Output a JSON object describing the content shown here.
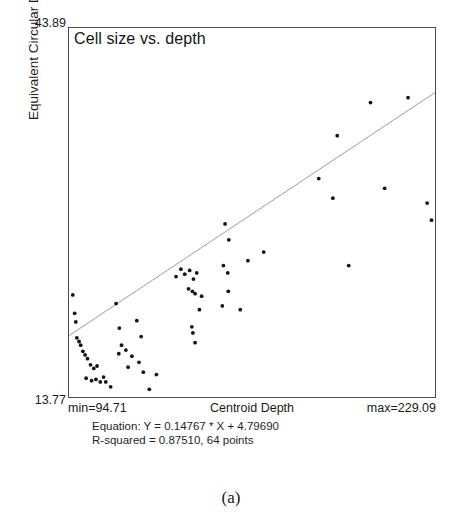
{
  "figure": {
    "caption": "(a)"
  },
  "chart_data": {
    "type": "scatter",
    "title": "Cell size vs. depth",
    "xlabel": "Centroid Depth",
    "ylabel": "Equivalent Circular Diameter",
    "xlim": [
      94.71,
      229.09
    ],
    "ylim": [
      13.77,
      43.89
    ],
    "x_min_label": "min=94.71",
    "x_max_label": "max=229.09",
    "y_min_label": "13.77",
    "y_max_label": "43.89",
    "grid": false,
    "legend": false,
    "n_points": 64,
    "marker_color": "#141414",
    "line_color": "#9a9a9a",
    "fit": {
      "type": "linear",
      "slope": 0.14767,
      "intercept": 4.7969,
      "r_squared": 0.8751,
      "equation_label": "Equation: Y = 0.14767 * X + 4.79690",
      "r_squared_label": "R-squared = 0.87510, 64 points"
    },
    "points": [
      [
        96.1,
        22.1
      ],
      [
        96.8,
        20.6
      ],
      [
        97.2,
        19.9
      ],
      [
        97.6,
        18.6
      ],
      [
        98.4,
        18.3
      ],
      [
        99.0,
        18.0
      ],
      [
        99.8,
        17.5
      ],
      [
        100.6,
        17.2
      ],
      [
        101.5,
        16.9
      ],
      [
        102.6,
        16.4
      ],
      [
        103.8,
        16.1
      ],
      [
        105.0,
        16.3
      ],
      [
        101.0,
        15.3
      ],
      [
        103.0,
        15.1
      ],
      [
        104.6,
        15.2
      ],
      [
        106.2,
        15.0
      ],
      [
        107.4,
        15.4
      ],
      [
        108.2,
        15.0
      ],
      [
        110.0,
        14.6
      ],
      [
        112.0,
        21.4
      ],
      [
        113.2,
        19.4
      ],
      [
        114.0,
        18.0
      ],
      [
        113.0,
        17.3
      ],
      [
        115.6,
        17.6
      ],
      [
        116.4,
        16.2
      ],
      [
        117.8,
        17.1
      ],
      [
        119.6,
        20.0
      ],
      [
        121.2,
        18.7
      ],
      [
        120.4,
        16.6
      ],
      [
        122.0,
        15.8
      ],
      [
        124.2,
        14.4
      ],
      [
        126.8,
        15.6
      ],
      [
        134.0,
        23.6
      ],
      [
        135.8,
        24.2
      ],
      [
        137.2,
        23.8
      ],
      [
        139.0,
        24.1
      ],
      [
        140.4,
        23.4
      ],
      [
        141.6,
        23.9
      ],
      [
        138.6,
        22.6
      ],
      [
        140.0,
        22.4
      ],
      [
        141.0,
        22.2
      ],
      [
        143.4,
        22.0
      ],
      [
        142.6,
        20.9
      ],
      [
        139.8,
        19.5
      ],
      [
        140.2,
        19.0
      ],
      [
        141.0,
        18.2
      ],
      [
        152.0,
        27.9
      ],
      [
        153.4,
        26.6
      ],
      [
        151.4,
        24.5
      ],
      [
        153.0,
        23.9
      ],
      [
        153.2,
        22.4
      ],
      [
        151.0,
        21.2
      ],
      [
        157.6,
        20.9
      ],
      [
        160.4,
        24.9
      ],
      [
        166.2,
        25.6
      ],
      [
        186.4,
        31.6
      ],
      [
        193.2,
        35.1
      ],
      [
        191.6,
        30.0
      ],
      [
        197.4,
        24.5
      ],
      [
        205.4,
        37.8
      ],
      [
        210.6,
        30.8
      ],
      [
        219.2,
        38.2
      ],
      [
        226.2,
        29.6
      ],
      [
        227.8,
        28.2
      ]
    ],
    "fit_line_endpoints": [
      [
        94.71,
        18.78
      ],
      [
        229.09,
        38.62
      ]
    ]
  }
}
